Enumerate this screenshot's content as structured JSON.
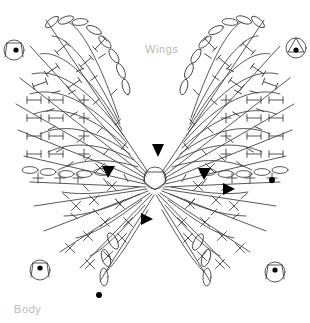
{
  "diagram": {
    "type": "crochet-chart",
    "background_color": "#ffffff",
    "stroke_color": "#3a3a3a",
    "label_color": "#b9b9b9",
    "marker_color": "#000000",
    "labels": {
      "wings": "Wings",
      "body": "Body"
    },
    "center_hub": {
      "x": 155,
      "y": 178,
      "r": 11
    },
    "stitch_markers": [
      {
        "name": "marker-top-left",
        "x": 14,
        "y": 50
      },
      {
        "name": "marker-top-right",
        "x": 296,
        "y": 48
      },
      {
        "name": "marker-bottom-left",
        "x": 40,
        "y": 270
      },
      {
        "name": "marker-bottom-right",
        "x": 275,
        "y": 272
      }
    ],
    "triangles": [
      {
        "name": "triangle-left",
        "x": 108,
        "y": 170,
        "dir": "down"
      },
      {
        "name": "triangle-right",
        "x": 204,
        "y": 172,
        "dir": "down"
      },
      {
        "name": "triangle-center",
        "x": 158,
        "y": 152,
        "dir": "down"
      },
      {
        "name": "triangle-lower",
        "x": 146,
        "y": 219,
        "dir": "right"
      },
      {
        "name": "triangle-inner-right",
        "x": 228,
        "y": 189,
        "dir": "right"
      }
    ],
    "dots": [
      {
        "name": "dot-right",
        "x": 272,
        "y": 180,
        "r": 3
      },
      {
        "name": "dot-bottom",
        "x": 99,
        "y": 295,
        "r": 3
      }
    ]
  }
}
